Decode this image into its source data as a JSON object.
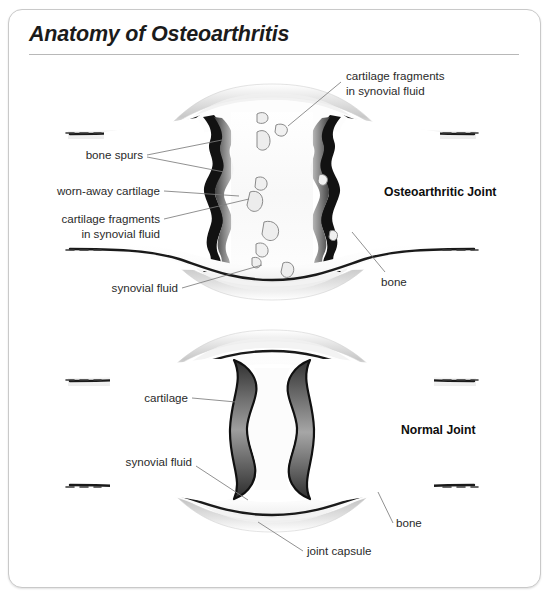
{
  "card": {
    "title": "Anatomy of Osteoarthritis"
  },
  "diagram": {
    "type": "medical-illustration",
    "panels": [
      {
        "id": "osteoarthritic",
        "heading": "Osteoarthritic Joint",
        "labels": [
          "cartilage fragments in synovial fluid",
          "bone spurs",
          "worn-away cartilage",
          "cartilage fragments in synovial fluid",
          "synovial fluid",
          "bone"
        ]
      },
      {
        "id": "normal",
        "heading": "Normal Joint",
        "labels": [
          "cartilage",
          "synovial fluid",
          "bone",
          "joint capsule"
        ]
      }
    ]
  },
  "annotations": {
    "oa_heading": "Osteoarthritic Joint",
    "normal_heading": "Normal Joint",
    "frag_top_line1": "cartilage fragments",
    "frag_top_line2": "in synovial fluid",
    "bone_spurs": "bone spurs",
    "worn_cartilage": "worn-away cartilage",
    "frag_left_line1": "cartilage fragments",
    "frag_left_line2": "in synovial fluid",
    "synovial_fluid_oa": "synovial fluid",
    "bone_oa": "bone",
    "cartilage_normal": "cartilage",
    "synovial_fluid_normal": "synovial fluid",
    "bone_normal": "bone",
    "joint_capsule": "joint capsule"
  },
  "colors": {
    "card_border": "#c9c9c9",
    "title": "#1b1b1b",
    "label": "#2a2a2a",
    "leader": "#7d7d7d",
    "bone_outline": "#141414",
    "cartilage_dark": "#4e4e4e",
    "cartilage_mid": "#8d8d8d",
    "cartilage_light": "#cfcfcf",
    "capsule": "#d8d8d8",
    "fluid": "#fbfbfb",
    "fragment": "#efefef"
  }
}
